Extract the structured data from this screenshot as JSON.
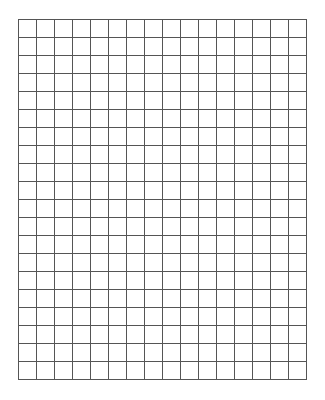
{
  "grid": {
    "columns": 16,
    "rows": 20,
    "cell_size_px": 18,
    "line_color": "#555555",
    "background_color": "#ffffff"
  }
}
